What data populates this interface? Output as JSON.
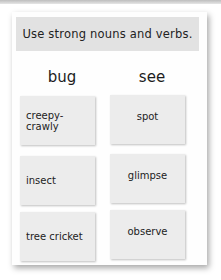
{
  "banner": "Use strong nouns and verbs.",
  "columns": [
    {
      "heading": "bug",
      "words": [
        "creepy-crawly",
        "insect",
        "tree cricket"
      ]
    },
    {
      "heading": "see",
      "words": [
        "spot",
        "glimpse",
        "observe"
      ]
    }
  ]
}
